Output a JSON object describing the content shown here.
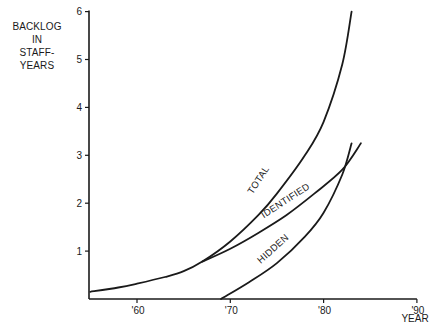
{
  "chart_data": {
    "type": "line",
    "title": "",
    "ylabel_lines": [
      "BACKLOG",
      "IN",
      "STAFF-YEARS"
    ],
    "xlabel": "YEAR",
    "xlim": [
      1955,
      1990
    ],
    "ylim": [
      0,
      6
    ],
    "x_ticks": [
      {
        "year": 60,
        "label": "'60"
      },
      {
        "year": 70,
        "label": "'70"
      },
      {
        "year": 80,
        "label": "'80"
      },
      {
        "year": 90,
        "label": "'90"
      }
    ],
    "y_ticks": [
      1,
      2,
      3,
      4,
      5,
      6
    ],
    "grid": false,
    "legend": "inline curve labels",
    "series": [
      {
        "name": "TOTAL",
        "points": [
          [
            55,
            0.15
          ],
          [
            58,
            0.24
          ],
          [
            60,
            0.32
          ],
          [
            63,
            0.46
          ],
          [
            65,
            0.58
          ],
          [
            67,
            0.78
          ],
          [
            70,
            1.2
          ],
          [
            73,
            1.75
          ],
          [
            75,
            2.2
          ],
          [
            78,
            3.0
          ],
          [
            80,
            3.7
          ],
          [
            82,
            4.9
          ],
          [
            83,
            6.0
          ]
        ],
        "label_pos": {
          "year": 73.3,
          "value": 2.45,
          "angle": -57
        }
      },
      {
        "name": "IDENTIFIED",
        "points": [
          [
            67,
            0.78
          ],
          [
            70,
            1.05
          ],
          [
            73,
            1.38
          ],
          [
            76,
            1.75
          ],
          [
            79,
            2.2
          ],
          [
            82,
            2.7
          ],
          [
            84,
            3.25
          ]
        ],
        "label_pos": {
          "year": 76.1,
          "value": 2.0,
          "angle": -33
        }
      },
      {
        "name": "HIDDEN",
        "points": [
          [
            69,
            0.0
          ],
          [
            72,
            0.35
          ],
          [
            75,
            0.75
          ],
          [
            78,
            1.3
          ],
          [
            80,
            1.8
          ],
          [
            82,
            2.6
          ],
          [
            83,
            3.25
          ]
        ],
        "label_pos": {
          "year": 74.8,
          "value": 1.0,
          "angle": -42
        }
      }
    ]
  }
}
